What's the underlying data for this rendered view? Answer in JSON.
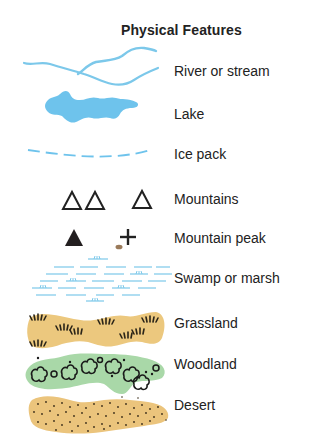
{
  "legend": {
    "title": "Physical Features",
    "items": [
      {
        "key": "river",
        "label": "River or stream",
        "icon": "river-icon",
        "color": "#7cc8ea"
      },
      {
        "key": "lake",
        "label": "Lake",
        "icon": "lake-icon",
        "color": "#6ec3ec"
      },
      {
        "key": "icepack",
        "label": "Ice pack",
        "icon": "ice-pack-icon",
        "color": "#6ec3ec"
      },
      {
        "key": "mountains",
        "label": "Mountains",
        "icon": "mountains-icon",
        "color": "#222222"
      },
      {
        "key": "peak",
        "label": "Mountain peak",
        "icon": "mountain-peak-icon",
        "color": "#222222"
      },
      {
        "key": "swamp",
        "label": "Swamp or marsh",
        "icon": "swamp-icon",
        "color": "#7cc8ea"
      },
      {
        "key": "grassland",
        "label": "Grassland",
        "icon": "grassland-icon",
        "color": "#ecc87e"
      },
      {
        "key": "woodland",
        "label": "Woodland",
        "icon": "woodland-icon",
        "color": "#a9d8a8"
      },
      {
        "key": "desert",
        "label": "Desert",
        "icon": "desert-icon",
        "color": "#ebc47c"
      }
    ]
  }
}
